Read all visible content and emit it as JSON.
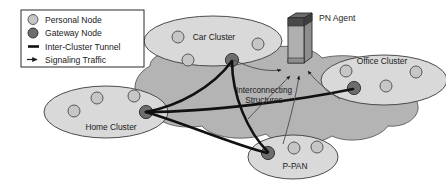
{
  "figure": {
    "background": "#ffffff"
  },
  "colors": {
    "personal_node_fill": "#c6c6c6",
    "gateway_node_fill": "#6d6d6d",
    "cluster_fill": "#d9d9d9",
    "interconnect_cloud_fill": "#b4b4b4",
    "outline": "#3a3a3a",
    "tunnel_line": "#111111",
    "signaling_line": "#555555",
    "agent_body": "#b0b0b0",
    "agent_top": "#4a4a4a",
    "text": "#1a1a1a"
  },
  "legend": {
    "name": "diagram-legend",
    "items": [
      {
        "symbol": "personal-node-circle",
        "label": "Personal Node"
      },
      {
        "symbol": "gateway-node-circle",
        "label": "Gateway Node"
      },
      {
        "symbol": "tunnel-line",
        "label": "Inter-Cluster Tunnel"
      },
      {
        "symbol": "signaling-arrow",
        "label": "Signaling Traffic"
      }
    ]
  },
  "agent": {
    "label": "PN Agent",
    "icon": "server-tower-icon"
  },
  "interconnect": {
    "line1": "Interconnecting",
    "line2": "Structures"
  },
  "clusters": [
    {
      "id": "car-cluster",
      "label": "Car Cluster",
      "personal_node_count": 3,
      "gateway_node_count": 1
    },
    {
      "id": "office-cluster",
      "label": "Office Cluster",
      "personal_node_count": 3,
      "gateway_node_count": 1
    },
    {
      "id": "home-cluster",
      "label": "Home Cluster",
      "personal_node_count": 3,
      "gateway_node_count": 1
    },
    {
      "id": "p-pan-cluster",
      "label": "P-PAN",
      "personal_node_count": 2,
      "gateway_node_count": 1
    }
  ],
  "connections": {
    "tunnels": [
      {
        "from": "home-cluster-gateway",
        "to": "car-cluster-gateway"
      },
      {
        "from": "home-cluster-gateway",
        "to": "office-cluster-gateway"
      },
      {
        "from": "home-cluster-gateway",
        "to": "p-pan-gateway"
      },
      {
        "from": "car-cluster-gateway",
        "to": "p-pan-gateway"
      }
    ],
    "signaling": [
      {
        "from": "car-cluster-gateway",
        "to": "pn-agent"
      },
      {
        "from": "home-cluster-gateway",
        "to": "pn-agent"
      },
      {
        "from": "p-pan-gateway",
        "to": "pn-agent"
      },
      {
        "from": "office-cluster-gateway",
        "to": "pn-agent"
      }
    ]
  }
}
